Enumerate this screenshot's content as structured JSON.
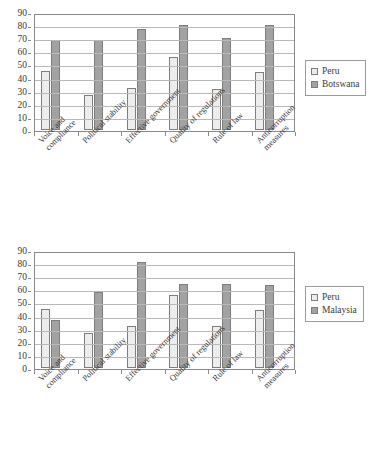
{
  "charts": [
    {
      "id": "top",
      "legend": {
        "position": "right",
        "entries": [
          "Peru",
          "Botswana"
        ]
      },
      "chart_data": {
        "type": "bar",
        "title": "",
        "xlabel": "",
        "ylabel": "",
        "ylim": [
          0,
          90
        ],
        "yticks": [
          0,
          10,
          20,
          30,
          40,
          50,
          60,
          70,
          80,
          90
        ],
        "grid": true,
        "categories": [
          "Voice and\ncompliance",
          "Political stability",
          "Effective government",
          "Quality of regulations",
          "Rule of law",
          "Anticorruption measures"
        ],
        "series": [
          {
            "name": "Peru",
            "color": "#ededed",
            "values": [
              45,
              27,
              32,
              56,
              31,
              44
            ]
          },
          {
            "name": "Botswana",
            "color": "#a2a2a2",
            "values": [
              69,
              69,
              77,
              80,
              70,
              80
            ]
          }
        ]
      }
    },
    {
      "id": "bottom",
      "legend": {
        "position": "right",
        "entries": [
          "Peru",
          "Malaysia"
        ]
      },
      "chart_data": {
        "type": "bar",
        "title": "",
        "xlabel": "",
        "ylabel": "",
        "ylim": [
          0,
          90
        ],
        "yticks": [
          0,
          10,
          20,
          30,
          40,
          50,
          60,
          70,
          80,
          90
        ],
        "grid": true,
        "categories": [
          "Voice and\ncompliance",
          "Political stability",
          "Effective government",
          "Quality of regulations",
          "Rule of law",
          "Anticorruption measures"
        ],
        "series": [
          {
            "name": "Peru",
            "color": "#ededed",
            "values": [
              45,
              27,
              32,
              56,
              32,
              44
            ]
          },
          {
            "name": "Malaysia",
            "color": "#a2a2a2",
            "values": [
              37,
              58,
              81,
              64,
              64,
              63
            ]
          }
        ]
      }
    }
  ]
}
